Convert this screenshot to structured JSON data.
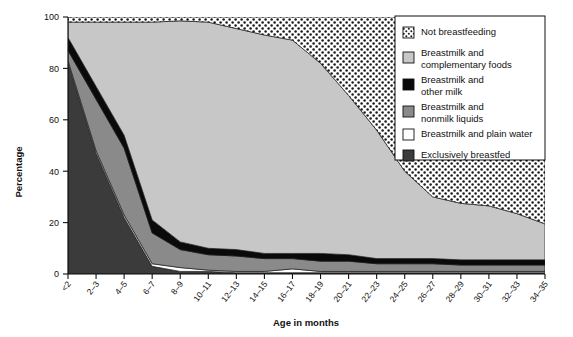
{
  "chart_data": {
    "type": "area",
    "title": "",
    "subtitle": "",
    "xlabel": "Age in months",
    "ylabel": "Percentage",
    "ylim": [
      0,
      100
    ],
    "yticks": [
      0,
      20,
      40,
      60,
      80,
      100
    ],
    "grid": false,
    "stacked": true,
    "stack_order_bottom_to_top": [
      "Exclusively breastfed",
      "Breastmilk and plain water",
      "Breastmilk and nonmilk liquids",
      "Breastmilk and other milk",
      "Breastmilk and complementary foods",
      "Not breastfeeding"
    ],
    "legend_position": "top-right",
    "categories": [
      "<2",
      "2–3",
      "4–5",
      "6–7",
      "8–9",
      "10–11",
      "12–13",
      "14–15",
      "16–17",
      "18–19",
      "20–21",
      "22–23",
      "24–25",
      "26–27",
      "28–29",
      "30–31",
      "32–33",
      "34–35"
    ],
    "series": [
      {
        "name": "Exclusively breastfed",
        "color": "#3b3b3b",
        "pattern": "solid",
        "values": [
          82,
          47,
          22,
          3,
          1,
          1,
          0.5,
          0.5,
          0.5,
          0.5,
          0.5,
          0.5,
          0.5,
          0.5,
          0.5,
          0.5,
          0.5,
          0.5
        ]
      },
      {
        "name": "Breastmilk and plain water",
        "color": "#ffffff",
        "pattern": "solid",
        "values": [
          1,
          1,
          1,
          1,
          1.5,
          0.5,
          0.5,
          0.5,
          1.5,
          0.5,
          0.5,
          0.5,
          0.5,
          0.5,
          0.5,
          0.5,
          0.5,
          0.5
        ]
      },
      {
        "name": "Breastmilk and nonmilk liquids",
        "color": "#8a8a8a",
        "pattern": "solid",
        "values": [
          4,
          20,
          26,
          12,
          7,
          6,
          6,
          5,
          4,
          4,
          4,
          3,
          3,
          3,
          2.5,
          2.5,
          2.5,
          2.5
        ]
      },
      {
        "name": "Breastmilk and other milk",
        "color": "#0a0a0a",
        "pattern": "solid",
        "values": [
          5,
          5,
          5,
          5,
          3,
          2.5,
          2.5,
          2,
          2,
          3,
          2.5,
          2,
          2,
          2,
          2,
          2,
          2,
          2
        ]
      },
      {
        "name": "Breastmilk and complementary foods",
        "color": "#c7c7c7",
        "pattern": "solid",
        "values": [
          6,
          25,
          44,
          77,
          86,
          88,
          86,
          85,
          83,
          74,
          62,
          50,
          34,
          24,
          22,
          21,
          18,
          14
        ]
      },
      {
        "name": "Not breastfeeding",
        "color": "#ffffff",
        "pattern": "dotted",
        "values": [
          2,
          2,
          2,
          2,
          1.5,
          2,
          4.5,
          7,
          9,
          18,
          30.5,
          44,
          60,
          70,
          72.5,
          73.5,
          76.5,
          80.5
        ]
      }
    ]
  },
  "axes": {
    "ylabel": "Percentage",
    "xlabel": "Age in months",
    "ytick_labels": [
      "0",
      "20",
      "40",
      "60",
      "80",
      "100"
    ],
    "xtick_labels": [
      "<2",
      "2–3",
      "4–5",
      "6–7",
      "8–9",
      "10–11",
      "12–13",
      "14–15",
      "16–17",
      "18–19",
      "20–21",
      "22–23",
      "24–25",
      "26–27",
      "28–29",
      "30–31",
      "32–33",
      "34–35"
    ]
  },
  "legend": {
    "items": [
      {
        "label": "Not breastfeeding",
        "swatch": "dotted",
        "color": "#ffffff"
      },
      {
        "label": "Breastmilk and",
        "label2": "complementary foods",
        "swatch": "solid",
        "color": "#c7c7c7"
      },
      {
        "label": "Breastmilk and",
        "label2": "other milk",
        "swatch": "solid",
        "color": "#0a0a0a"
      },
      {
        "label": "Breastmilk and",
        "label2": "nonmilk liquids",
        "swatch": "solid",
        "color": "#8a8a8a"
      },
      {
        "label": "Breastmilk and plain water",
        "swatch": "solid",
        "color": "#ffffff"
      },
      {
        "label": "Exclusively breastfed",
        "swatch": "solid",
        "color": "#3b3b3b"
      }
    ]
  }
}
